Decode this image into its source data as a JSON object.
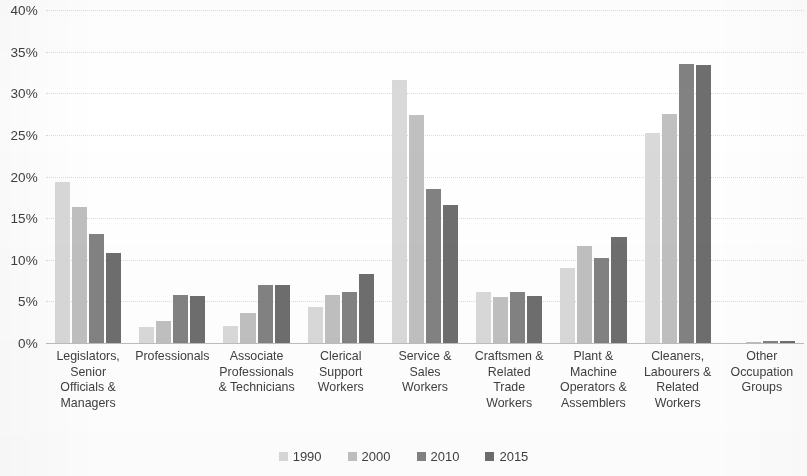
{
  "chart_data": {
    "type": "bar",
    "title": "",
    "xlabel": "",
    "ylabel": "",
    "ylim": [
      0,
      40
    ],
    "ytick_labels": [
      "40%",
      "35%",
      "30%",
      "25%",
      "20%",
      "15%",
      "10%",
      "5%",
      "0%"
    ],
    "ytick_values": [
      40,
      35,
      30,
      25,
      20,
      15,
      10,
      5,
      0
    ],
    "grid": true,
    "legend_position": "bottom",
    "value_suffix": "%",
    "categories": [
      "Legislators, Senior Officials & Managers",
      "Professionals",
      "Associate Professionals & Technicians",
      "Clerical Support Workers",
      "Service & Sales Workers",
      "Craftsmen & Related Trade Workers",
      "Plant & Machine Operators & Assemblers",
      "Cleaners, Labourers & Related Workers",
      "Other Occupation Groups"
    ],
    "category_labels_wrapped": [
      "Legislators,\nSenior\nOfficials &\nManagers",
      "Professionals",
      "Associate\nProfessionals\n& Technicians",
      "Clerical\nSupport\nWorkers",
      "Service &\nSales\nWorkers",
      "Craftsmen &\nRelated\nTrade\nWorkers",
      "Plant &\nMachine\nOperators &\nAssemblers",
      "Cleaners,\nLabourers &\nRelated\nWorkers",
      "Other\nOccupation\nGroups"
    ],
    "series": [
      {
        "name": "1990",
        "color": "#d9d9d9",
        "values": [
          19.4,
          1.9,
          2.1,
          4.3,
          31.6,
          6.1,
          9.0,
          25.2,
          0.0
        ]
      },
      {
        "name": "2000",
        "color": "#c0c0c0",
        "values": [
          16.3,
          2.7,
          3.6,
          5.8,
          27.4,
          5.5,
          11.6,
          27.5,
          0.1
        ]
      },
      {
        "name": "2010",
        "color": "#828282",
        "values": [
          13.1,
          5.8,
          7.0,
          6.1,
          18.5,
          6.1,
          10.2,
          33.5,
          0.2
        ]
      },
      {
        "name": "2015",
        "color": "#6e6e6e",
        "values": [
          10.8,
          5.7,
          7.0,
          8.3,
          16.6,
          5.7,
          12.7,
          33.4,
          0.3
        ]
      }
    ]
  }
}
